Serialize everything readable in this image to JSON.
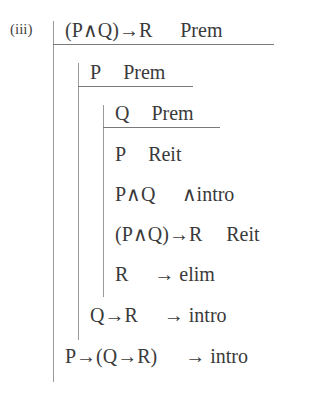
{
  "proof": {
    "label": "(iii)",
    "lines": [
      {
        "formula": "(P∧Q)→R",
        "justification": "Prem",
        "depth": 1
      },
      {
        "formula": "P",
        "justification": "Prem",
        "depth": 2
      },
      {
        "formula": "Q",
        "justification": "Prem",
        "depth": 3
      },
      {
        "formula": "P",
        "justification": "Reit",
        "depth": 3
      },
      {
        "formula": "P∧Q",
        "justification": "∧intro",
        "depth": 3
      },
      {
        "formula": "(P∧Q)→R",
        "justification": "Reit",
        "depth": 3
      },
      {
        "formula": "R",
        "justification": "→ elim",
        "depth": 3
      },
      {
        "formula": "Q→R",
        "justification": "→ intro",
        "depth": 2
      },
      {
        "formula": "P→(Q→R)",
        "justification": "→ intro",
        "depth": 1
      }
    ]
  }
}
